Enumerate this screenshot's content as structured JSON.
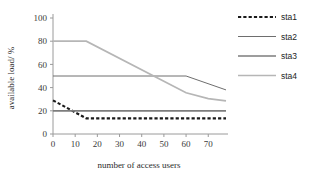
{
  "chart_data": {
    "type": "line",
    "title": "",
    "xlabel": "number of access users",
    "ylabel": "available load/ %",
    "xlim": [
      0,
      78
    ],
    "ylim": [
      0,
      100
    ],
    "xticks": [
      0,
      10,
      20,
      30,
      40,
      50,
      60,
      70
    ],
    "yticks": [
      0,
      20,
      40,
      60,
      80,
      100
    ],
    "grid": false,
    "legend_position": "top-right",
    "series": [
      {
        "name": "sta1",
        "color": "#1a1a1a",
        "style": "dashed",
        "width": 2.1,
        "x": [
          0,
          15,
          78
        ],
        "y": [
          29,
          13.5,
          13.5
        ]
      },
      {
        "name": "sta2",
        "color": "#6e6e6e",
        "style": "solid",
        "width": 1.0,
        "x": [
          0,
          60,
          78
        ],
        "y": [
          50,
          50,
          38
        ]
      },
      {
        "name": "sta3",
        "color": "#7d7d7d",
        "style": "solid",
        "width": 1.7,
        "x": [
          0,
          78
        ],
        "y": [
          20,
          20
        ]
      },
      {
        "name": "sta4",
        "color": "#b6b6b6",
        "style": "solid",
        "width": 1.7,
        "x": [
          0,
          15,
          60,
          70,
          78
        ],
        "y": [
          80,
          80,
          35.5,
          30.5,
          28.5
        ]
      }
    ]
  },
  "axes": {
    "y_title": "available load/ %",
    "x_title": "number of access users",
    "y_tick_labels": [
      "0",
      "20",
      "40",
      "60",
      "80",
      "100"
    ],
    "x_tick_labels": [
      "0",
      "10",
      "20",
      "30",
      "40",
      "50",
      "60",
      "70"
    ]
  },
  "legend": {
    "items": [
      {
        "label": "sta1",
        "color": "#1a1a1a",
        "style": "dashed",
        "width": 2.1
      },
      {
        "label": "sta2",
        "color": "#6e6e6e",
        "style": "solid",
        "width": 1.0
      },
      {
        "label": "sta3",
        "color": "#7d7d7d",
        "style": "solid",
        "width": 1.7
      },
      {
        "label": "sta4",
        "color": "#b6b6b6",
        "style": "solid",
        "width": 1.7
      }
    ]
  },
  "colors": {
    "axis": "#9a9a9a",
    "text": "#2b2b2b",
    "background": "#ffffff"
  }
}
